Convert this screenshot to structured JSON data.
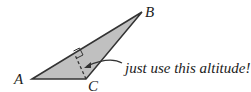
{
  "diagram": {
    "labels": {
      "A": "A",
      "B": "B",
      "C": "C"
    },
    "annotation": "just use this altitude!",
    "colors": {
      "fill": "#c0c0c0",
      "stroke": "#333333"
    }
  }
}
